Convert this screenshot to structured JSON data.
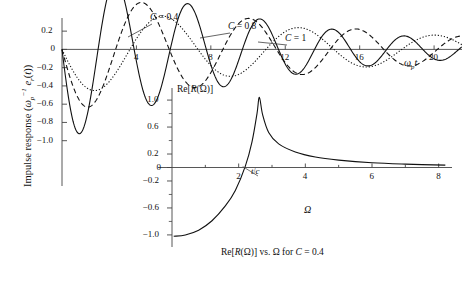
{
  "figure": {
    "main": {
      "ylabel_text": "Impulse response (ωp⁻¹ er(t))",
      "yticks": [
        "0.2",
        "0",
        "-0.2",
        "-0.4",
        "-0.6",
        "-0.8",
        "-1.0"
      ],
      "ytick_values": [
        0.2,
        0,
        -0.2,
        -0.4,
        -0.6,
        -0.8,
        -1.0
      ],
      "xticks": [
        "4",
        "8",
        "12",
        "16",
        "20"
      ],
      "xtick_values": [
        4,
        8,
        12,
        16,
        20
      ],
      "xlabel_text": "ωp t",
      "xlim": [
        0,
        21.5
      ],
      "ylim": [
        -1.08,
        0.3
      ],
      "curve_labels": [
        {
          "text": "C = 0.4",
          "x": 150,
          "y": 12
        },
        {
          "text": "C = 0.8",
          "x": 228,
          "y": 21
        },
        {
          "text": "C = 1",
          "x": 285,
          "y": 33
        }
      ]
    },
    "inset": {
      "title": "Re[R(Ω)]",
      "yticks": [
        "1.0",
        "0.6",
        "0.2",
        "0",
        "-0.2",
        "-0.6",
        "-1.0"
      ],
      "ytick_values": [
        1.0,
        0.6,
        0.2,
        0,
        -0.2,
        -0.6,
        -1.0
      ],
      "xticks": [
        "2",
        "4",
        "6",
        "8"
      ],
      "xtick_values": [
        2,
        4,
        6,
        8
      ],
      "xlabel_text": "Ω",
      "annotation": "t/c",
      "caption": "Re[R(Ω)] vs. Ω for C = 0.4",
      "xlim": [
        0,
        8.4
      ],
      "ylim": [
        -1.12,
        1.12
      ]
    }
  },
  "chart_data": [
    {
      "type": "line",
      "title": "Impulse response vs normalized time",
      "xlabel": "ωp t",
      "ylabel": "Impulse response (ωp⁻¹ er(t))",
      "xlim": [
        0,
        21.5
      ],
      "ylim": [
        -1.08,
        0.3
      ],
      "xticks": [
        4,
        8,
        12,
        16,
        20
      ],
      "yticks": [
        0.2,
        0,
        -0.2,
        -0.4,
        -0.6,
        -0.8,
        -1.0
      ],
      "grid": false,
      "legend": "inline-annotations",
      "series": [
        {
          "name": "C = 0.4",
          "style": "solid",
          "damping": 0.105,
          "frequency": 1.62,
          "phase": 0.0,
          "amplitude": 1.02,
          "key_points": [
            {
              "x": 0.0,
              "y": 0.0
            },
            {
              "x": 1.9,
              "y": -0.98
            },
            {
              "x": 3.85,
              "y": 0.235
            },
            {
              "x": 5.75,
              "y": -0.14
            },
            {
              "x": 7.6,
              "y": 0.1
            },
            {
              "x": 9.5,
              "y": -0.085
            },
            {
              "x": 11.4,
              "y": 0.06
            },
            {
              "x": 13.3,
              "y": -0.05
            },
            {
              "x": 15.2,
              "y": 0.035
            },
            {
              "x": 17.1,
              "y": -0.03
            },
            {
              "x": 19.0,
              "y": 0.02
            },
            {
              "x": 21.0,
              "y": -0.015
            }
          ]
        },
        {
          "name": "C = 0.8",
          "style": "dashed",
          "damping": 0.072,
          "frequency": 1.09,
          "phase": 0.0,
          "amplitude": 0.7,
          "key_points": [
            {
              "x": 0.0,
              "y": 0.0
            },
            {
              "x": 2.5,
              "y": -0.47
            },
            {
              "x": 5.4,
              "y": 0.105
            },
            {
              "x": 8.2,
              "y": -0.075
            },
            {
              "x": 11.0,
              "y": 0.055
            },
            {
              "x": 13.9,
              "y": -0.045
            },
            {
              "x": 16.7,
              "y": 0.035
            },
            {
              "x": 19.5,
              "y": -0.025
            },
            {
              "x": 21.5,
              "y": 0.015
            }
          ]
        },
        {
          "name": "C = 1",
          "style": "dotted",
          "damping": 0.058,
          "frequency": 0.86,
          "phase": 0.0,
          "amplitude": 0.5,
          "key_points": [
            {
              "x": 0.0,
              "y": 0.0
            },
            {
              "x": 3.0,
              "y": -0.345
            },
            {
              "x": 6.6,
              "y": 0.095
            },
            {
              "x": 10.2,
              "y": -0.07
            },
            {
              "x": 13.8,
              "y": 0.05
            },
            {
              "x": 17.4,
              "y": -0.04
            },
            {
              "x": 21.0,
              "y": 0.03
            }
          ]
        }
      ]
    },
    {
      "type": "line",
      "title": "Re[R(Ω)] vs. Ω for C = 0.4",
      "xlabel": "Ω",
      "ylabel": "Re[R(Ω)]",
      "xlim": [
        0,
        8.4
      ],
      "ylim": [
        -1.12,
        1.12
      ],
      "xticks": [
        2,
        4,
        6,
        8
      ],
      "yticks": [
        1.0,
        0.6,
        0.2,
        0,
        -0.2,
        -0.6,
        -1.0
      ],
      "grid": false,
      "annotations": [
        {
          "text": "t/c",
          "x": 2.6,
          "y": 0.22
        }
      ],
      "series": [
        {
          "name": "Re[R(Ω)]",
          "style": "solid",
          "resonance_x": 2.62,
          "peak_y": 1.04,
          "key_points": [
            {
              "x": 0.05,
              "y": -1.02
            },
            {
              "x": 0.4,
              "y": -1.0
            },
            {
              "x": 0.8,
              "y": -0.93
            },
            {
              "x": 1.2,
              "y": -0.79
            },
            {
              "x": 1.6,
              "y": -0.57
            },
            {
              "x": 1.9,
              "y": -0.34
            },
            {
              "x": 2.2,
              "y": 0.02
            },
            {
              "x": 2.4,
              "y": 0.38
            },
            {
              "x": 2.55,
              "y": 0.8
            },
            {
              "x": 2.62,
              "y": 1.04
            },
            {
              "x": 2.72,
              "y": 0.78
            },
            {
              "x": 2.9,
              "y": 0.52
            },
            {
              "x": 3.2,
              "y": 0.35
            },
            {
              "x": 3.7,
              "y": 0.23
            },
            {
              "x": 4.3,
              "y": 0.155
            },
            {
              "x": 5.0,
              "y": 0.11
            },
            {
              "x": 6.0,
              "y": 0.07
            },
            {
              "x": 7.0,
              "y": 0.05
            },
            {
              "x": 8.2,
              "y": 0.035
            }
          ]
        }
      ]
    }
  ]
}
